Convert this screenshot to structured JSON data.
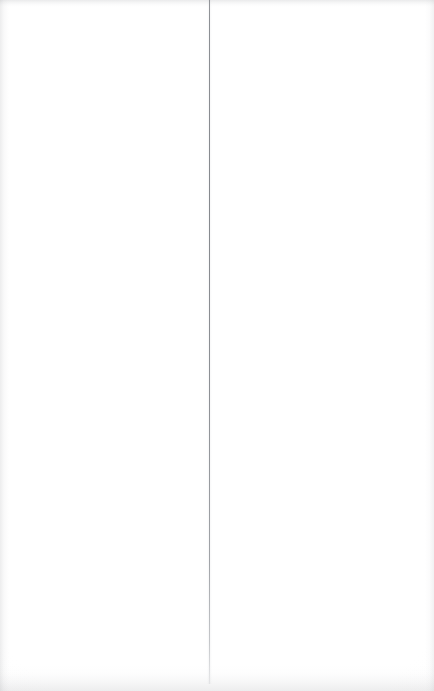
{
  "document": {
    "kind": "scanned-page",
    "page_width_px": 434,
    "page_height_px": 691,
    "orientation": "portrait",
    "visible_text": "",
    "background_color": "#fefefe",
    "note_text": ""
  },
  "marks": {
    "gutter_rule": {
      "name": "vertical-gutter-rule",
      "color": "#84878c",
      "x_px": 209,
      "top_px": 0,
      "bottom_px": 684,
      "height_px": 684,
      "thickness_px": 1
    }
  },
  "scan_artifacts": {
    "top_edge_band_color": "#96989c",
    "bottom_edge_band_color": "#94969a",
    "left_edge_band_color": "#929498",
    "right_edge_band_color": "#989a9e"
  }
}
